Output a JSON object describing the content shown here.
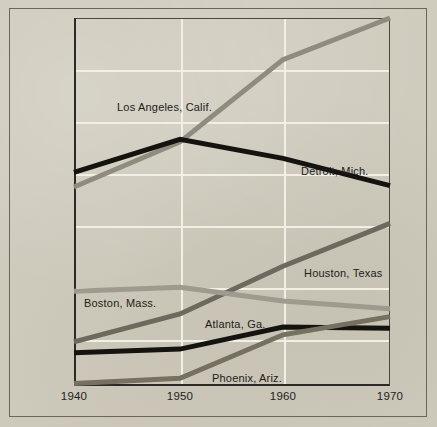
{
  "chart_data": {
    "type": "line",
    "title": "",
    "subtitle": "",
    "xlabel": "",
    "ylabel": "",
    "x": [
      1940,
      1950,
      1960,
      1970
    ],
    "xtick_labels": [
      "1940",
      "1950",
      "1960",
      "1970"
    ],
    "ytick_labels": [
      "2,800",
      "2,600",
      "2,200",
      "1,600",
      "1,200",
      "800",
      "400"
    ],
    "ytick_values": [
      2800,
      2600,
      2200,
      1600,
      1200,
      800,
      400
    ],
    "y_axis_note": "Tick labels are evenly spaced but numerically irregular (compressed upper scale)",
    "xlim": [
      1940,
      1970
    ],
    "grid": true,
    "grid_color": "#f2efe6",
    "legend_position": "inline-labels",
    "background_color": "#cfcbbd",
    "series": [
      {
        "name": "Los Angeles, Calif.",
        "color": "#8f8b7e",
        "values": [
          1500,
          1970,
          2640,
          2800
        ],
        "label_x": 117,
        "label_y": 101
      },
      {
        "name": "Detroit, Mich.",
        "color": "#141310",
        "values": [
          1620,
          2000,
          1780,
          1510
        ],
        "label_x": 301,
        "label_y": 165
      },
      {
        "name": "Houston, Texas",
        "color": "#6e695e",
        "values": [
          385,
          600,
          940,
          1220
        ],
        "label_x": 304,
        "label_y": 267
      },
      {
        "name": "Boston, Mass.",
        "color": "#9e9a8d",
        "values": [
          775,
          805,
          700,
          640
        ],
        "label_x": 84,
        "label_y": 297
      },
      {
        "name": "Atlanta, Ga.",
        "color": "#141310",
        "values": [
          302,
          330,
          500,
          490
        ],
        "label_x": 205,
        "label_y": 318
      },
      {
        "name": "Phoenix, Ariz.",
        "color": "#75705f",
        "values": [
          65,
          105,
          440,
          580
        ],
        "label_x": 212,
        "label_y": 372
      }
    ]
  },
  "axis": {
    "y_positions_px": [
      18,
      70,
      122,
      174,
      226,
      288,
      340
    ],
    "x_positions_px": [
      74,
      180,
      283,
      390
    ]
  }
}
